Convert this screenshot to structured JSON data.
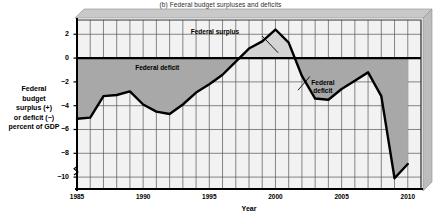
{
  "chart_data": {
    "type": "line",
    "title": "(b) Federal budget surpluses and deficits",
    "xlabel": "Year",
    "ylabel": "Federal budget surplus (+) or deficit (−) percent of GDP",
    "ylabel_lines": [
      "Federal",
      "budget",
      "surplus (+)",
      "or deficit (−)",
      "percent of GDP"
    ],
    "xlim": [
      1985,
      2011
    ],
    "ylim": [
      -11,
      3.2
    ],
    "grid": true,
    "legend": "none",
    "yticks": [
      2,
      0,
      -2,
      -4,
      -6,
      -8,
      -10
    ],
    "ytick_labels": [
      "2",
      "0",
      "−2",
      "−4",
      "−6",
      "−8",
      "−10"
    ],
    "xticks": [
      1985,
      1990,
      1995,
      2000,
      2005,
      2010
    ],
    "xtick_labels": [
      "1985",
      "1990",
      "1995",
      "2000",
      "2005",
      "2010"
    ],
    "x": [
      1985,
      1986,
      1987,
      1988,
      1989,
      1990,
      1991,
      1992,
      1993,
      1994,
      1995,
      1996,
      1997,
      1998,
      1999,
      2000,
      2001,
      2002,
      2003,
      2004,
      2005,
      2006,
      2007,
      2008,
      2009,
      2010
    ],
    "values": [
      -5.1,
      -5.0,
      -3.2,
      -3.1,
      -2.8,
      -3.9,
      -4.5,
      -4.7,
      -3.9,
      -2.9,
      -2.2,
      -1.4,
      -0.3,
      0.8,
      1.4,
      2.4,
      1.3,
      -1.5,
      -3.4,
      -3.5,
      -2.6,
      -1.9,
      -1.2,
      -3.2,
      -10.1,
      -8.9
    ],
    "series_name": "Federal budget surplus or deficit, percent of GDP",
    "annotations": [
      {
        "name": "federal-surplus",
        "text": "Federal surplus",
        "x": 2000,
        "y": 2.4
      },
      {
        "name": "federal-deficit-left",
        "text": "Federal deficit",
        "x": 1992,
        "y": -1.0
      },
      {
        "name": "federal-deficit-right",
        "text": "Federal deficit",
        "lines": [
          "Federal",
          "deficit"
        ],
        "x": 2002,
        "y": -2.6
      }
    ],
    "colors": {
      "line": "#000000",
      "deficit_fill": "#a8a8a8",
      "surplus_fill": "#d4d4d4",
      "plot_background": "#f2f2f2",
      "grid": "#555555",
      "panel_3d": "#c9c9c9"
    },
    "axis_break": true
  }
}
